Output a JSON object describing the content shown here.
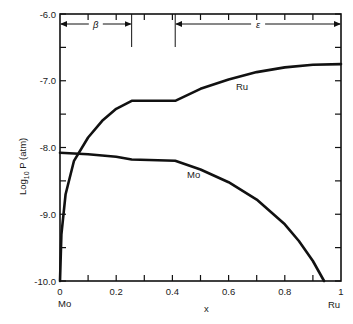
{
  "chart_data": {
    "type": "line",
    "title": "",
    "xlabel": "x",
    "ylabel": "Log10 P (atm)",
    "xlim": [
      0,
      1
    ],
    "ylim": [
      -10.0,
      -6.0
    ],
    "x_ticks": [
      0,
      0.2,
      0.4,
      0.6,
      0.8,
      1
    ],
    "x_tick_labels": [
      "0",
      "0.2",
      "0.4",
      "0.6",
      "0.8",
      "1"
    ],
    "y_ticks": [
      -6.0,
      -7.0,
      -8.0,
      -9.0,
      -10.0
    ],
    "y_tick_labels": [
      "-6.0",
      "-7.0",
      "-8.0",
      "-9.0",
      "-10.0"
    ],
    "x_end_labels": {
      "left": "Mo",
      "right": "Ru"
    },
    "grid": false,
    "phase_regions": [
      {
        "name": "β",
        "x_start": 0.0,
        "x_end": 0.255
      },
      {
        "name": "ε",
        "x_start": 0.41,
        "x_end": 1.0
      }
    ],
    "series": [
      {
        "name": "Ru",
        "x": [
          0.0,
          0.005,
          0.02,
          0.05,
          0.1,
          0.15,
          0.2,
          0.255,
          0.41,
          0.5,
          0.6,
          0.7,
          0.8,
          0.9,
          1.0
        ],
        "y": [
          -10.0,
          -9.3,
          -8.7,
          -8.2,
          -7.85,
          -7.6,
          -7.42,
          -7.3,
          -7.3,
          -7.12,
          -6.98,
          -6.87,
          -6.8,
          -6.76,
          -6.75
        ]
      },
      {
        "name": "Mo",
        "x": [
          0.0,
          0.1,
          0.2,
          0.255,
          0.41,
          0.5,
          0.6,
          0.7,
          0.8,
          0.85,
          0.9,
          0.94
        ],
        "y": [
          -8.08,
          -8.1,
          -8.14,
          -8.18,
          -8.2,
          -8.33,
          -8.52,
          -8.78,
          -9.15,
          -9.4,
          -9.7,
          -10.0
        ]
      }
    ]
  },
  "labels": {
    "y_axis_title": "Log",
    "y_axis_sub": "10",
    "y_axis_rest": " P (atm)",
    "x_axis_title": "x",
    "ru_curve_label": "Ru",
    "mo_curve_label": "Mo",
    "beta_label": "β",
    "epsilon_label": "ε",
    "x_left_end": "Mo",
    "x_right_end": "Ru"
  }
}
